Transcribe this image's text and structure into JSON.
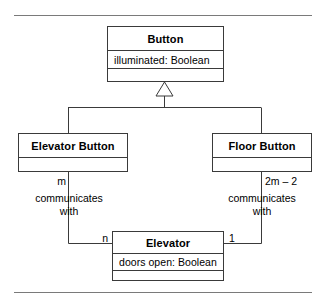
{
  "diagram": {
    "kind": "uml-class-diagram",
    "stroke_color": "#3a3a3a",
    "text_color": "#000000",
    "background": "#ffffff",
    "rules": {
      "top_label": "top-divider-rule",
      "bottom_label": "bottom-divider-rule"
    },
    "classes": [
      {
        "id": "button",
        "name": "Button",
        "attributes": [
          "illuminated: Boolean"
        ],
        "has_empty_operations_compartment": true
      },
      {
        "id": "elevator-button",
        "name": "Elevator Button",
        "attributes": [],
        "has_empty_operations_compartment": true
      },
      {
        "id": "floor-button",
        "name": "Floor Button",
        "attributes": [],
        "has_empty_operations_compartment": true
      },
      {
        "id": "elevator",
        "name": "Elevator",
        "attributes": [
          "doors open: Boolean"
        ],
        "has_empty_operations_compartment": true
      }
    ],
    "generalization": {
      "parent": "Button",
      "children": [
        "Elevator Button",
        "Floor Button"
      ],
      "arrow": "hollow-triangle"
    },
    "associations": [
      {
        "id": "elevator-button-to-elevator",
        "from": "Elevator Button",
        "to": "Elevator",
        "label_line1": "communicates",
        "label_line2": "with",
        "source_multiplicity": "m",
        "target_multiplicity": "n"
      },
      {
        "id": "floor-button-to-elevator",
        "from": "Floor Button",
        "to": "Elevator",
        "label_line1": "communicates",
        "label_line2": "with",
        "source_multiplicity": "2m – 2",
        "target_multiplicity": "1"
      }
    ]
  }
}
